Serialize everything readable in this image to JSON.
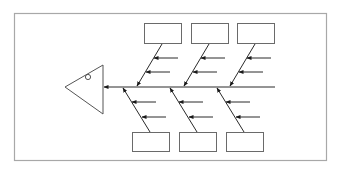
{
  "diagram": {
    "type": "fishbone",
    "title": "",
    "colors": {
      "frame": "#a8a8a8",
      "line": "#2a2a2a",
      "box": "#6a6a6a"
    },
    "head": {
      "label": ""
    },
    "top_categories": [
      {
        "label": ""
      },
      {
        "label": ""
      },
      {
        "label": ""
      }
    ],
    "bottom_categories": [
      {
        "label": ""
      },
      {
        "label": ""
      },
      {
        "label": ""
      }
    ]
  }
}
